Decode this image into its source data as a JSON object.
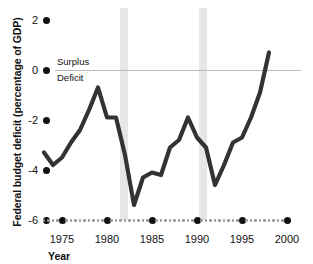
{
  "chart_data": {
    "type": "line",
    "title": "",
    "xlabel": "Year",
    "ylabel": "Federal budget deficit (percentage of GDP)",
    "xlim": [
      1973,
      2000
    ],
    "ylim": [
      -6,
      2
    ],
    "grid": false,
    "legend": "none",
    "yticks": [
      "2",
      "0",
      "-2",
      "-4",
      "-6"
    ],
    "ytick_values": [
      2,
      0,
      -2,
      -4,
      -6
    ],
    "xticks": [
      "1975",
      "1980",
      "1985",
      "1990",
      "1995",
      "2000"
    ],
    "xtick_values": [
      1975,
      1980,
      1985,
      1990,
      1995,
      2000
    ],
    "annotations": [
      {
        "text": "Surplus",
        "x": 1974.5,
        "y": 0.45
      },
      {
        "text": "Deficit",
        "x": 1974.5,
        "y": -0.5
      }
    ],
    "zero_line": 0,
    "shaded_bands": [
      {
        "label": "recession",
        "x0": 1981.4,
        "x1": 1982.3,
        "color": "#e6e6e6"
      },
      {
        "label": "recession",
        "x0": 1990.2,
        "x1": 1991.1,
        "color": "#e6e6e6"
      }
    ],
    "series": [
      {
        "name": "Federal budget deficit",
        "color": "#333333",
        "x": [
          1973,
          1974,
          1975,
          1976,
          1977,
          1978,
          1979,
          1980,
          1981,
          1982,
          1983,
          1984,
          1985,
          1986,
          1987,
          1988,
          1989,
          1990,
          1991,
          1992,
          1993,
          1994,
          1995,
          1996,
          1997,
          1998
        ],
        "values": [
          -3.3,
          -3.8,
          -3.5,
          -2.9,
          -2.4,
          -1.6,
          -0.7,
          -1.9,
          -1.9,
          -3.4,
          -5.4,
          -4.3,
          -4.1,
          -4.2,
          -3.1,
          -2.8,
          -1.9,
          -2.7,
          -3.1,
          -4.6,
          -3.8,
          -2.9,
          -2.7,
          -1.9,
          -0.9,
          0.7
        ]
      }
    ]
  }
}
